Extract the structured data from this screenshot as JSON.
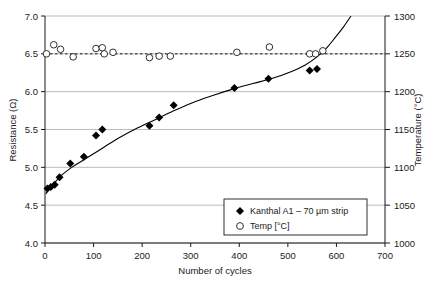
{
  "chart_data": {
    "type": "scatter",
    "title": "",
    "xlabel": "Number of cycles",
    "ylabel": "Resistance (Ω)",
    "y2label": "Temperature (°C)",
    "xlim": [
      0,
      700
    ],
    "ylim": [
      4.0,
      7.0
    ],
    "y2lim": [
      1000,
      1300
    ],
    "grid": true,
    "legend_position": "bottom-right",
    "xticks": [
      "0",
      "100",
      "200",
      "300",
      "400",
      "500",
      "600",
      "700"
    ],
    "xtick_values": [
      0,
      100,
      200,
      300,
      400,
      500,
      600,
      700
    ],
    "yticks": [
      "4.0",
      "4.5",
      "5.0",
      "5.5",
      "6.0",
      "6.5",
      "7.0"
    ],
    "ytick_values": [
      4.0,
      4.5,
      5.0,
      5.5,
      6.0,
      6.5,
      7.0
    ],
    "y2ticks": [
      "1000",
      "1050",
      "1100",
      "1150",
      "1200",
      "1250",
      "1300"
    ],
    "y2tick_values": [
      1000,
      1050,
      1100,
      1150,
      1200,
      1250,
      1300
    ],
    "series": [
      {
        "name": "Kanthal A1 – 70 µm strip",
        "marker": "filled-diamond",
        "axis": "left",
        "points": [
          [
            5,
            4.72
          ],
          [
            12,
            4.74
          ],
          [
            20,
            4.77
          ],
          [
            30,
            4.87
          ],
          [
            52,
            5.05
          ],
          [
            80,
            5.14
          ],
          [
            105,
            5.42
          ],
          [
            118,
            5.5
          ],
          [
            215,
            5.55
          ],
          [
            235,
            5.66
          ],
          [
            265,
            5.82
          ],
          [
            390,
            6.05
          ],
          [
            460,
            6.17
          ],
          [
            545,
            6.28
          ],
          [
            560,
            6.3
          ]
        ]
      },
      {
        "name": "Temp [°C]",
        "marker": "open-circle",
        "axis": "right",
        "points": [
          [
            3,
            1250
          ],
          [
            18,
            1262
          ],
          [
            32,
            1256
          ],
          [
            58,
            1246
          ],
          [
            105,
            1257
          ],
          [
            118,
            1258
          ],
          [
            122,
            1250
          ],
          [
            140,
            1252
          ],
          [
            215,
            1245
          ],
          [
            235,
            1247
          ],
          [
            258,
            1247
          ],
          [
            395,
            1252
          ],
          [
            462,
            1259
          ],
          [
            545,
            1250
          ],
          [
            557,
            1250
          ],
          [
            572,
            1254
          ]
        ]
      }
    ],
    "reference_line": {
      "name": "temperature-setpoint",
      "style": "dashed",
      "axis": "right",
      "value": 1250
    },
    "trend_curve": {
      "name": "resistance-trend",
      "style": "solid",
      "axis": "left",
      "points": [
        [
          2,
          4.65
        ],
        [
          10,
          4.73
        ],
        [
          20,
          4.8
        ],
        [
          35,
          4.9
        ],
        [
          55,
          5.0
        ],
        [
          80,
          5.1
        ],
        [
          110,
          5.22
        ],
        [
          150,
          5.38
        ],
        [
          190,
          5.52
        ],
        [
          230,
          5.64
        ],
        [
          270,
          5.76
        ],
        [
          310,
          5.87
        ],
        [
          350,
          5.96
        ],
        [
          390,
          6.04
        ],
        [
          430,
          6.11
        ],
        [
          470,
          6.18
        ],
        [
          505,
          6.26
        ],
        [
          535,
          6.35
        ],
        [
          560,
          6.46
        ],
        [
          580,
          6.58
        ],
        [
          598,
          6.72
        ],
        [
          615,
          6.86
        ],
        [
          630,
          7.0
        ]
      ]
    }
  },
  "legend": {
    "entries": [
      {
        "label": "Kanthal A1 – 70 µm strip",
        "marker": "filled-diamond"
      },
      {
        "label": "Temp [°C]",
        "marker": "open-circle"
      }
    ]
  },
  "colors": {
    "axis": "#1a1a1a",
    "grid": "#b4b4b4",
    "marker": "#000000",
    "curve": "#000000",
    "background": "#ffffff"
  }
}
